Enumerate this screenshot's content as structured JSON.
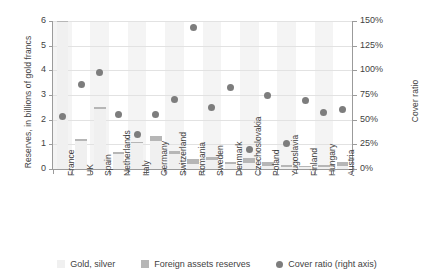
{
  "chart_data": {
    "type": "bar",
    "title": "",
    "xlabel": "",
    "ylabel": "Reserves, in billions of gold francs",
    "ylabel_right": "Cover ratio",
    "ylim": [
      0,
      6
    ],
    "ylim_right": [
      0,
      150
    ],
    "yticks": [
      "0",
      "1",
      "2",
      "3",
      "4",
      "5",
      "6"
    ],
    "yticks_right": [
      "0%",
      "25%",
      "50%",
      "75%",
      "100%",
      "125%",
      "150%"
    ],
    "grid": true,
    "legend_position": "bottom",
    "categories": [
      "France",
      "UK",
      "Spain",
      "Netherlands",
      "Italy",
      "Germany",
      "Switzerland",
      "Romania",
      "Sweden",
      "Denmark",
      "Czechoslovakia",
      "Poland",
      "Yugoslavia",
      "Finland",
      "Hungary",
      "Austria"
    ],
    "series": [
      {
        "name": "Gold, silver",
        "color": "#f0f0f0",
        "unit": "billions of gold francs",
        "values": [
          5.95,
          1.15,
          2.45,
          0.62,
          1.05,
          1.15,
          0.6,
          0.22,
          0.35,
          0.2,
          0.24,
          0.12,
          0.09,
          0.07,
          0.1,
          0.12
        ]
      },
      {
        "name": "Foreign assets reserves",
        "color": "#b6b6b6",
        "unit": "billions of gold francs",
        "values": [
          0.05,
          0.05,
          0.03,
          0.05,
          0.06,
          0.2,
          0.12,
          0.18,
          0.12,
          0.1,
          0.2,
          0.18,
          0.06,
          0.06,
          0.07,
          0.18
        ]
      },
      {
        "name": "Cover ratio (right axis)",
        "color": "#7d7d7d",
        "unit": "%",
        "type": "scatter",
        "axis": "right",
        "values": [
          53,
          86,
          98,
          55,
          35,
          55,
          70,
          143,
          62,
          83,
          20,
          74,
          26,
          69,
          57,
          60
        ]
      }
    ]
  },
  "legend": {
    "items": [
      {
        "label": "Gold, silver",
        "marker": "square-swatch"
      },
      {
        "label": "Foreign assets reserves",
        "marker": "square-swatch"
      },
      {
        "label": "Cover ratio (right axis)",
        "marker": "circle-marker"
      }
    ]
  }
}
